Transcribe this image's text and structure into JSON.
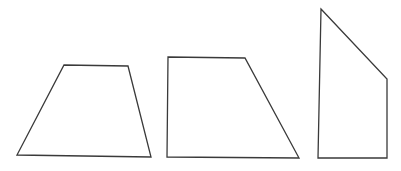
{
  "figure": {
    "width": 401,
    "height": 171,
    "background": "#ffffff",
    "stroke_color": "#3a3a3a",
    "shapes": [
      {
        "name": "isosceles-like-trapezoid",
        "type": "quadrilateral",
        "points": "64,65 128,66 151,157 17,155"
      },
      {
        "name": "right-trapezoid",
        "type": "quadrilateral",
        "points": "168,57 245,58 299,158 167,157"
      },
      {
        "name": "irregular-quadrilateral",
        "type": "quadrilateral",
        "points": "321,9 387,79 387,158 318,158"
      }
    ]
  }
}
